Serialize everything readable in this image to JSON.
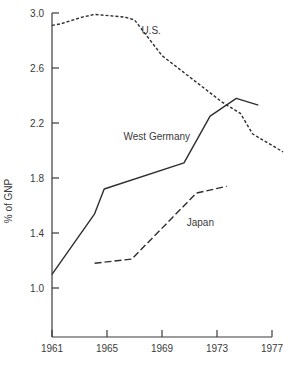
{
  "chart_data": {
    "type": "line",
    "title": "",
    "xlabel": "",
    "ylabel": "% of GNP",
    "xlim": [
      1961,
      1977
    ],
    "ylim": [
      0.6,
      3.0
    ],
    "x_ticks": [
      "1961",
      "1965",
      "1969",
      "1973",
      "1977"
    ],
    "y_ticks": [
      "3.0",
      "2.6",
      "2.2",
      "1.8",
      "1.4",
      "1.0"
    ],
    "grid": false,
    "legend": "inline labels",
    "series": [
      {
        "name": "U.S.",
        "style": "short-dash",
        "label_pos": [
          1967.5,
          2.85
        ],
        "points": [
          [
            1961,
            2.91
          ],
          [
            1961.6,
            2.92
          ],
          [
            1963.2,
            2.97
          ],
          [
            1964.1,
            2.99
          ],
          [
            1966.3,
            2.97
          ],
          [
            1967.0,
            2.95
          ],
          [
            1969.0,
            2.69
          ],
          [
            1973.4,
            2.35
          ],
          [
            1974.7,
            2.27
          ],
          [
            1975.6,
            2.12
          ],
          [
            1977.8,
            1.99
          ]
        ]
      },
      {
        "name": "West Germany",
        "style": "solid",
        "label_pos": [
          1966.2,
          2.08
        ],
        "points": [
          [
            1961,
            1.1
          ],
          [
            1964.1,
            1.54
          ],
          [
            1964.8,
            1.72
          ],
          [
            1970.6,
            1.91
          ],
          [
            1972.5,
            2.25
          ],
          [
            1974.4,
            2.38
          ],
          [
            1976.0,
            2.33
          ]
        ]
      },
      {
        "name": "Japan",
        "style": "long-dash",
        "label_pos": [
          1970.8,
          1.45
        ],
        "points": [
          [
            1964.1,
            1.18
          ],
          [
            1966.8,
            1.21
          ],
          [
            1971.5,
            1.69
          ],
          [
            1973.7,
            1.74
          ]
        ]
      }
    ]
  }
}
